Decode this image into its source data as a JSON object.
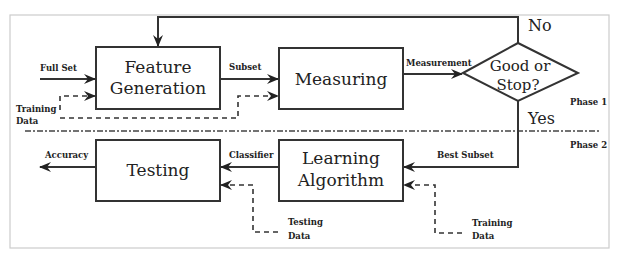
{
  "diagram": {
    "type": "flowchart",
    "phases": {
      "phase1": "Phase 1",
      "phase2": "Phase 2"
    },
    "nodes": {
      "feature_generation": {
        "line1": "Feature",
        "line2": "Generation"
      },
      "measuring": {
        "line1": "Measuring"
      },
      "decision": {
        "line1": "Good or",
        "line2": "Stop?"
      },
      "learning_algorithm": {
        "line1": "Learning",
        "line2": "Algorithm"
      },
      "testing": {
        "line1": "Testing"
      }
    },
    "edge_labels": {
      "full_set": "Full Set",
      "subset": "Subset",
      "measurement": "Measurement",
      "no": "No",
      "yes": "Yes",
      "best_subset": "Best Subset",
      "classifier": "Classifier",
      "accuracy": "Accuracy",
      "training_data_top_1": "Training",
      "training_data_top_2": "Data",
      "testing_data_1": "Testing",
      "testing_data_2": "Data",
      "training_data_bottom_1": "Training",
      "training_data_bottom_2": "Data"
    },
    "edges": [
      {
        "from": "input",
        "to": "feature_generation",
        "label": "Full Set",
        "style": "solid"
      },
      {
        "from": "training_data",
        "to": "feature_generation",
        "label": "Training Data",
        "style": "dashed"
      },
      {
        "from": "training_data",
        "to": "measuring",
        "style": "dashed"
      },
      {
        "from": "feature_generation",
        "to": "measuring",
        "label": "Subset",
        "style": "solid"
      },
      {
        "from": "measuring",
        "to": "decision",
        "label": "Measurement",
        "style": "solid"
      },
      {
        "from": "decision",
        "to": "feature_generation",
        "label": "No",
        "style": "solid"
      },
      {
        "from": "decision",
        "to": "learning_algorithm",
        "label": "Yes / Best Subset",
        "style": "solid"
      },
      {
        "from": "training_data",
        "to": "learning_algorithm",
        "label": "Training Data",
        "style": "dashed"
      },
      {
        "from": "learning_algorithm",
        "to": "testing",
        "label": "Classifier",
        "style": "solid"
      },
      {
        "from": "testing_data",
        "to": "testing",
        "label": "Testing Data",
        "style": "dashed"
      },
      {
        "from": "testing",
        "to": "output",
        "label": "Accuracy",
        "style": "solid"
      }
    ]
  }
}
